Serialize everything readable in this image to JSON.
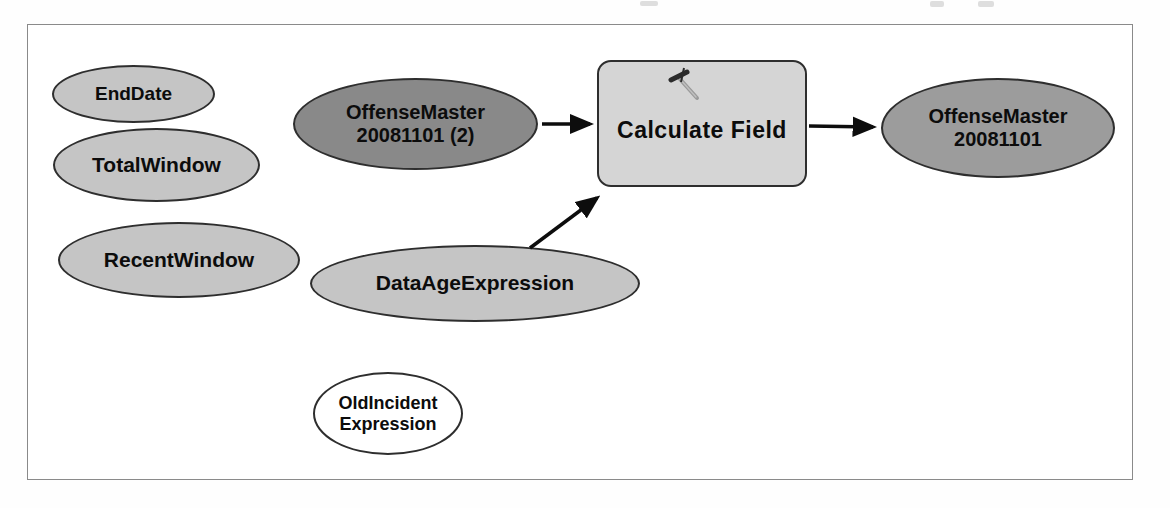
{
  "figure": {
    "kind": "geoprocessing-model-diagram",
    "nodes": {
      "end_date": {
        "label": "EndDate",
        "role": "variable"
      },
      "total_window": {
        "label": "TotalWindow",
        "role": "variable"
      },
      "recent_window": {
        "label": "RecentWindow",
        "role": "variable"
      },
      "offense_master_input": {
        "line1": "OffenseMaster",
        "line2": "20081101 (2)",
        "role": "input-data"
      },
      "data_age_expression": {
        "label": "DataAgeExpression",
        "role": "variable"
      },
      "old_incident_expression": {
        "line1": "OldIncident",
        "line2": "Expression",
        "role": "unfilled-variable"
      },
      "calculate_field": {
        "label": "Calculate Field",
        "icon": "hammer-icon",
        "role": "tool"
      },
      "offense_master_output": {
        "line1": "OffenseMaster",
        "line2": "20081101",
        "role": "output-data"
      }
    },
    "edges": [
      {
        "from": "OffenseMaster 20081101 (2)",
        "to": "Calculate Field"
      },
      {
        "from": "DataAgeExpression",
        "to": "Calculate Field"
      },
      {
        "from": "Calculate Field",
        "to": "OffenseMaster 20081101"
      }
    ],
    "colors": {
      "variable_fill": "#c5c5c5",
      "input_data_fill": "#898989",
      "output_data_fill": "#9c9c9c",
      "tool_fill": "#d5d5d5",
      "unfilled_fill": "#ffffff",
      "outline": "#2e2e2e",
      "arrow": "#0d0d0d",
      "frame_border": "#8a8a8a"
    }
  }
}
